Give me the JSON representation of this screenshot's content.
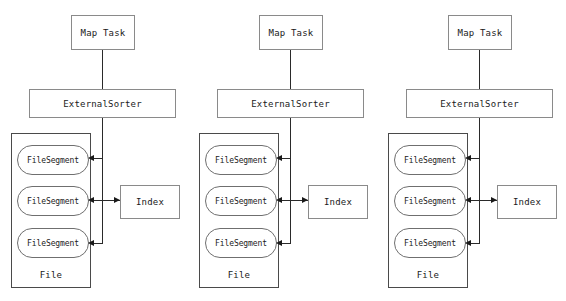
{
  "diagram": {
    "type": "block-diagram",
    "colors": {
      "background": "#ffffff",
      "box_border": "#8a8a8a",
      "file_border": "#4a4a4a",
      "segment_border": "#6f6f6f",
      "connector": "#2a2a2a",
      "text": "#1a1a1a"
    },
    "labels": {
      "map_task": "Map Task",
      "external_sorter": "ExternalSorter",
      "index": "Index",
      "file": "File",
      "file_segment": "FileSegment"
    },
    "groups": [
      {
        "id": "group-1",
        "offset_x": 0,
        "map_task": "Map Task",
        "external_sorter": "ExternalSorter",
        "index": "Index",
        "file": "File",
        "segments": [
          "FileSegment",
          "FileSegment",
          "FileSegment"
        ]
      },
      {
        "id": "group-2",
        "offset_x": 188,
        "map_task": "Map Task",
        "external_sorter": "ExternalSorter",
        "index": "Index",
        "file": "File",
        "segments": [
          "FileSegment",
          "FileSegment",
          "FileSegment"
        ]
      },
      {
        "id": "group-3",
        "offset_x": 377,
        "map_task": "Map Task",
        "external_sorter": "ExternalSorter",
        "index": "Index",
        "file": "File",
        "segments": [
          "FileSegment",
          "FileSegment",
          "FileSegment"
        ]
      }
    ],
    "connections": [
      {
        "from": "Map Task",
        "to": "ExternalSorter",
        "style": "line"
      },
      {
        "from": "ExternalSorter",
        "to": "FileSegment",
        "style": "arrow"
      },
      {
        "from": "FileSegment",
        "to": "Index",
        "style": "bidirectional-arrow"
      }
    ]
  }
}
